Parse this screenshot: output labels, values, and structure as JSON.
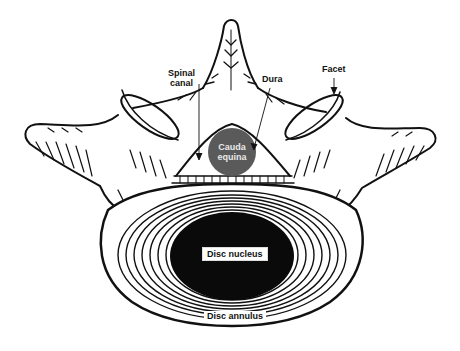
{
  "figure": {
    "colors": {
      "line": "#111111",
      "background": "#ffffff",
      "cauda_equina_fill": "#5a5a5a",
      "nucleus_fill": "#0a0a0a"
    },
    "labels": {
      "spinal_canal_line1": "Spinal",
      "spinal_canal_line2": "canal",
      "dura": "Dura",
      "facet": "Facet",
      "cauda_line1": "Cauda",
      "cauda_line2": "equina",
      "disc_nucleus": "Disc nucleus",
      "disc_annulus": "Disc annulus"
    }
  }
}
